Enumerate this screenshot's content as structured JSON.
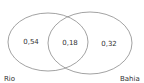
{
  "diagram": {
    "type": "venn",
    "sets": [
      {
        "name": "Rio",
        "only_value": "0,54"
      },
      {
        "name": "Bahia",
        "only_value": "0,32"
      }
    ],
    "intersection_value": "0,18",
    "labels": {
      "left_set": "Rio",
      "right_set": "Bahia",
      "left_only": "0,54",
      "intersection": "0,18",
      "right_only": "0,32"
    },
    "colors": {
      "outline": "#8a8a8a",
      "text": "#333333",
      "background": "#ffffff"
    }
  }
}
